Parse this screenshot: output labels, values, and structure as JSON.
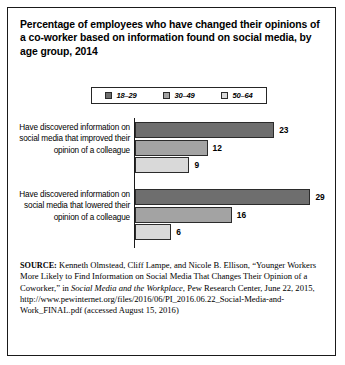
{
  "title": "Percentage of employees who have changed their opinions of a co-worker based on information found on social media, by age group, 2014",
  "legend": {
    "items": [
      {
        "label": "18–29",
        "color": "#6e6e6e"
      },
      {
        "label": "30–49",
        "color": "#a3a3a3"
      },
      {
        "label": "50–64",
        "color": "#d9d9d9"
      }
    ]
  },
  "source": {
    "prefix": "SOURCE:",
    "text_1": " Kenneth Olmstead, Cliff Lampe, and Nicole B. Ellison, “Younger Workers More Likely to Find Information on Social Media That Changes Their Opinion of a Coworker,” in ",
    "italic_1": "Social Media and the Workplace",
    "text_2": ", Pew Research Center, June 22, 2015, http://www.pewinternet.org/files/2016/06/PI_2016.06.22_Social-Media-and-Work_FINAL.pdf (accessed August 15, 2016)"
  },
  "chart_data": {
    "type": "bar",
    "title": "Percentage of employees who have changed their opinions of a co-worker based on information found on social media, by age group, 2014",
    "xlabel": "",
    "ylabel": "",
    "orientation": "horizontal",
    "grid": false,
    "legend_position": "top",
    "xlim": [
      0,
      30
    ],
    "categories": [
      "Have discovered information on social media that improved their opinion of a colleague",
      "Have discovered information on social media that lowered their opinion of a colleague"
    ],
    "series": [
      {
        "name": "18–29",
        "color": "#6e6e6e",
        "values": [
          23,
          29
        ]
      },
      {
        "name": "30–49",
        "color": "#a3a3a3",
        "values": [
          12,
          16
        ]
      },
      {
        "name": "50–64",
        "color": "#d9d9d9",
        "values": [
          9,
          6
        ]
      }
    ]
  }
}
